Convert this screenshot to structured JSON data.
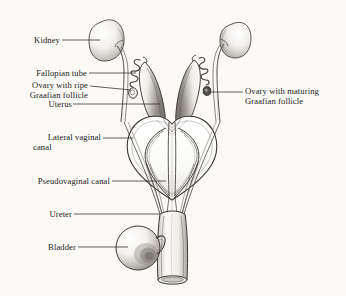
{
  "figure": {
    "background_color": "#fbfaf7",
    "ink_color": "#1d1b1a",
    "line_color": "#3b3734"
  },
  "labels": {
    "kidney": "Kidney",
    "fallopian_tube": "Fallopian tube",
    "ovary_ripe_line1": "Ovary with ripe",
    "ovary_ripe_line2": "Graafian follicle",
    "uterus": "Uterus",
    "lateral_vaginal_line1": "Lateral vaginal",
    "lateral_vaginal_line2": "canal",
    "pseudovaginal_canal": "Pseudovaginal canal",
    "ureter": "Ureter",
    "bladder": "Bladder",
    "ovary_maturing_line1": "Ovary with maturing",
    "ovary_maturing_line2": "Graafian follicle"
  },
  "structures": [
    {
      "name": "left-kidney",
      "label": "Kidney"
    },
    {
      "name": "right-kidney",
      "label": "Kidney"
    },
    {
      "name": "left-ureter",
      "label": "Ureter"
    },
    {
      "name": "right-ureter",
      "label": "Ureter"
    },
    {
      "name": "left-fallopian-tube",
      "label": "Fallopian tube"
    },
    {
      "name": "right-fallopian-tube",
      "label": "Fallopian tube"
    },
    {
      "name": "left-ovary",
      "label": "Ovary with ripe Graafian follicle"
    },
    {
      "name": "right-ovary",
      "label": "Ovary with maturing Graafian follicle"
    },
    {
      "name": "uterus",
      "label": "Uterus"
    },
    {
      "name": "lateral-vaginal-canal",
      "label": "Lateral vaginal canal"
    },
    {
      "name": "pseudovaginal-canal",
      "label": "Pseudovaginal canal"
    },
    {
      "name": "bladder",
      "label": "Bladder"
    },
    {
      "name": "urogenital-sinus",
      "label": "Urogenital sinus"
    }
  ]
}
